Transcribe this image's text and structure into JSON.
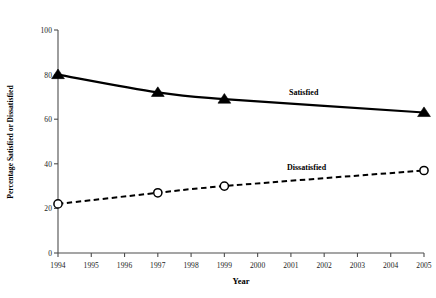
{
  "chart_data": {
    "type": "line",
    "title": "",
    "xlabel": "Year",
    "ylabel": "Percentage Satisfied or Dissatisfied",
    "x": [
      1994,
      1997,
      1999,
      2005
    ],
    "xlim": [
      1994,
      2005
    ],
    "ylim": [
      0,
      100
    ],
    "yticks": [
      0,
      20,
      40,
      60,
      80,
      100
    ],
    "xticks": [
      1994,
      1995,
      1996,
      1997,
      1998,
      1999,
      2000,
      2001,
      2002,
      2003,
      2004,
      2005
    ],
    "grid": false,
    "legend_position": "inline-annotation",
    "series": [
      {
        "name": "Satisfied",
        "values": [
          80,
          72,
          69,
          63
        ],
        "marker": "filled-triangle",
        "linestyle": "solid",
        "color": "#000000"
      },
      {
        "name": "Dissatisfied",
        "values": [
          22,
          27,
          30,
          37
        ],
        "marker": "open-circle",
        "linestyle": "dashed",
        "color": "#000000"
      }
    ],
    "annotations": [
      {
        "text": "Satisfied",
        "series": "Satisfied"
      },
      {
        "text": "Dissatisfied",
        "series": "Dissatisfied"
      }
    ]
  },
  "axes": {
    "y_title": "Percentage Satisfied or Dissatisfied",
    "x_title": "Year",
    "y_tick_labels": [
      "100",
      "80",
      "60",
      "40",
      "20",
      "0"
    ],
    "x_tick_labels": [
      "1994",
      "1995",
      "1996",
      "1997",
      "1998",
      "1999",
      "2000",
      "2001",
      "2002",
      "2003",
      "2004",
      "2005"
    ]
  },
  "annotations": {
    "satisfied": "Satisfied",
    "dissatisfied": "Dissatisfied"
  },
  "colors": {
    "line": "#000000",
    "axis": "#4d4d4d",
    "background": "#ffffff",
    "tick_text": "#1a1a1a"
  }
}
